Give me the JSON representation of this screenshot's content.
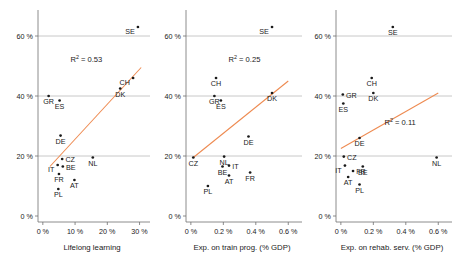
{
  "figure": {
    "type": "scatter-panel-figure",
    "panel_count": 3,
    "marker_color": "#1a1a1a",
    "fit_line_color": "#ee8a50",
    "grid_color": "#9a9a9a",
    "background": "#ffffff"
  },
  "chart_data": [
    {
      "type": "scatter",
      "title": "",
      "xlabel": "Lifelong learning",
      "ylabel": "",
      "xlim": [
        -1.5,
        32
      ],
      "ylim": [
        -2,
        68
      ],
      "xticks": [
        0,
        10,
        20,
        30
      ],
      "xticklabels": [
        "0 %",
        "10 %",
        "20 %",
        "30 %"
      ],
      "yticks": [
        0,
        20,
        40,
        60
      ],
      "yticklabels": [
        "0 %",
        "20 %",
        "40 %",
        "60 %"
      ],
      "grid": true,
      "grid_axis": "y",
      "legend": "none",
      "annotations": [
        {
          "text": "R² = 0.53",
          "base": "R",
          "sup": "2",
          "rest": " = 0.53",
          "x": 13.5,
          "y": 51.5
        }
      ],
      "trendline": {
        "x": [
          2.2,
          30.5
        ],
        "y": [
          16.5,
          49.5
        ]
      },
      "points": [
        {
          "label": "SE",
          "x": 29.5,
          "y": 63.0,
          "label_pos": "left"
        },
        {
          "label": "CH",
          "x": 28.0,
          "y": 46.0,
          "label_pos": "left"
        },
        {
          "label": "DK",
          "x": 24.0,
          "y": 42.5,
          "label_pos": "below"
        },
        {
          "label": "GR",
          "x": 1.8,
          "y": 40.0,
          "label_pos": "below"
        },
        {
          "label": "ES",
          "x": 5.2,
          "y": 38.5,
          "label_pos": "below"
        },
        {
          "label": "DE",
          "x": 5.5,
          "y": 26.8,
          "label_pos": "below"
        },
        {
          "label": "CZ",
          "x": 6.0,
          "y": 19.0,
          "label_pos": "right"
        },
        {
          "label": "NL",
          "x": 15.5,
          "y": 19.5,
          "label_pos": "below"
        },
        {
          "label": "IT",
          "x": 4.6,
          "y": 17.0,
          "label_pos": "left"
        },
        {
          "label": "BE",
          "x": 6.2,
          "y": 16.5,
          "label_pos": "right"
        },
        {
          "label": "FR",
          "x": 5.0,
          "y": 14.0,
          "label_pos": "below"
        },
        {
          "label": "AT",
          "x": 9.8,
          "y": 12.0,
          "label_pos": "below"
        },
        {
          "label": "PL",
          "x": 4.8,
          "y": 9.0,
          "label_pos": "below"
        }
      ]
    },
    {
      "type": "scatter",
      "title": "",
      "xlabel": "Exp. on train prog. (% GDP)",
      "ylabel": "",
      "xlim": [
        -0.03,
        0.66
      ],
      "ylim": [
        -2,
        68
      ],
      "xticks": [
        0.0,
        0.2,
        0.4,
        0.6
      ],
      "xticklabels": [
        "0 %",
        "0.2 %",
        "0.4 %",
        "0.6 %"
      ],
      "yticks": [
        0,
        20,
        40,
        60
      ],
      "yticklabels": [
        "0 %",
        "20 %",
        "40 %",
        "60 %"
      ],
      "grid": true,
      "grid_axis": "y",
      "legend": "none",
      "annotations": [
        {
          "text": "R² = 0.25",
          "base": "R",
          "sup": "2",
          "rest": " = 0.25",
          "x": 0.33,
          "y": 51.5
        }
      ],
      "trendline": {
        "x": [
          0.015,
          0.6
        ],
        "y": [
          19.5,
          45.0
        ]
      },
      "points": [
        {
          "label": "SE",
          "x": 0.5,
          "y": 63.0,
          "label_pos": "left"
        },
        {
          "label": "CH",
          "x": 0.155,
          "y": 46.0,
          "label_pos": "below"
        },
        {
          "label": "DK",
          "x": 0.5,
          "y": 41.0,
          "label_pos": "below"
        },
        {
          "label": "GR",
          "x": 0.145,
          "y": 40.0,
          "label_pos": "below"
        },
        {
          "label": "ES",
          "x": 0.185,
          "y": 38.5,
          "label_pos": "below"
        },
        {
          "label": "DE",
          "x": 0.355,
          "y": 26.5,
          "label_pos": "below"
        },
        {
          "label": "CZ",
          "x": 0.015,
          "y": 19.5,
          "label_pos": "below"
        },
        {
          "label": "NL",
          "x": 0.205,
          "y": 19.8,
          "label_pos": "below"
        },
        {
          "label": "BE",
          "x": 0.195,
          "y": 16.5,
          "label_pos": "below"
        },
        {
          "label": "IT",
          "x": 0.235,
          "y": 16.8,
          "label_pos": "right"
        },
        {
          "label": "AT",
          "x": 0.235,
          "y": 13.5,
          "label_pos": "below"
        },
        {
          "label": "FR",
          "x": 0.365,
          "y": 14.5,
          "label_pos": "below"
        },
        {
          "label": "PL",
          "x": 0.105,
          "y": 10.0,
          "label_pos": "below"
        }
      ]
    },
    {
      "type": "scatter",
      "title": "",
      "xlabel": "Exp. on rehab. serv. (% GDP)",
      "ylabel": "",
      "xlim": [
        -0.03,
        0.66
      ],
      "ylim": [
        -2,
        68
      ],
      "xticks": [
        0.0,
        0.2,
        0.4,
        0.6
      ],
      "xticklabels": [
        "0 %",
        "0.2 %",
        "0.4 %",
        "0.6 %"
      ],
      "yticks": [
        0,
        20,
        40,
        60
      ],
      "yticklabels": [
        "0 %",
        "20 %",
        "40 %",
        "60 %"
      ],
      "grid": true,
      "grid_axis": "y",
      "legend": "none",
      "annotations": [
        {
          "text": "R² = 0.11",
          "base": "R",
          "sup": "2",
          "rest": " = 0.11",
          "x": 0.365,
          "y": 30.5
        }
      ],
      "trendline": {
        "x": [
          0.0,
          0.6
        ],
        "y": [
          22.5,
          41.0
        ]
      },
      "points": [
        {
          "label": "SE",
          "x": 0.32,
          "y": 63.0,
          "label_pos": "below"
        },
        {
          "label": "CH",
          "x": 0.19,
          "y": 46.0,
          "label_pos": "below"
        },
        {
          "label": "DK",
          "x": 0.2,
          "y": 41.0,
          "label_pos": "below"
        },
        {
          "label": "GR",
          "x": 0.012,
          "y": 40.5,
          "label_pos": "right"
        },
        {
          "label": "ES",
          "x": 0.015,
          "y": 37.5,
          "label_pos": "below"
        },
        {
          "label": "DE",
          "x": 0.115,
          "y": 26.0,
          "label_pos": "below"
        },
        {
          "label": "CZ",
          "x": 0.018,
          "y": 19.8,
          "label_pos": "right"
        },
        {
          "label": "NL",
          "x": 0.59,
          "y": 19.5,
          "label_pos": "below"
        },
        {
          "label": "IT",
          "x": 0.025,
          "y": 16.8,
          "label_pos": "left"
        },
        {
          "label": "BE",
          "x": 0.135,
          "y": 16.5,
          "label_pos": "below"
        },
        {
          "label": "FR",
          "x": 0.075,
          "y": 15.0,
          "label_pos": "right"
        },
        {
          "label": "AT",
          "x": 0.045,
          "y": 13.0,
          "label_pos": "below"
        },
        {
          "label": "PL",
          "x": 0.115,
          "y": 10.5,
          "label_pos": "below"
        }
      ]
    }
  ]
}
